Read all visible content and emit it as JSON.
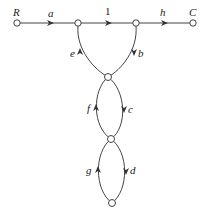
{
  "diagram": {
    "type": "signal-flow-graph",
    "nodes": [
      {
        "id": "R",
        "label": "R"
      },
      {
        "id": "n1",
        "label": ""
      },
      {
        "id": "n2",
        "label": ""
      },
      {
        "id": "C",
        "label": "C"
      },
      {
        "id": "n3",
        "label": ""
      },
      {
        "id": "n4",
        "label": ""
      },
      {
        "id": "n5",
        "label": ""
      }
    ],
    "edges": [
      {
        "from": "R",
        "to": "n1",
        "gain": "a"
      },
      {
        "from": "n1",
        "to": "n2",
        "gain": "1"
      },
      {
        "from": "n2",
        "to": "C",
        "gain": "h"
      },
      {
        "from": "n2",
        "to": "n3",
        "gain": "b"
      },
      {
        "from": "n3",
        "to": "n1",
        "gain": "e"
      },
      {
        "from": "n3",
        "to": "n4",
        "gain": "c"
      },
      {
        "from": "n4",
        "to": "n3",
        "gain": "f"
      },
      {
        "from": "n4",
        "to": "n5",
        "gain": "d"
      },
      {
        "from": "n5",
        "to": "n4",
        "gain": "g"
      }
    ],
    "labels": {
      "R": "R",
      "C": "C",
      "a": "a",
      "one": "1",
      "h": "h",
      "e": "e",
      "b": "b",
      "f": "f",
      "c": "c",
      "g": "g",
      "d": "d"
    }
  }
}
